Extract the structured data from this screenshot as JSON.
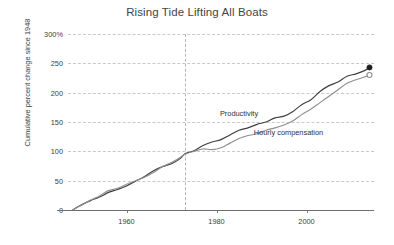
{
  "chart_data": {
    "type": "line",
    "title": "Rising Tide Lifting All Boats",
    "xlabel": "",
    "ylabel": "Cumulative percent change since 1948",
    "xlim": [
      1947,
      2015
    ],
    "ylim": [
      0,
      300
    ],
    "grid": true,
    "legend_position": "inline-annotation",
    "ytick_labels": [
      "0",
      "50",
      "100",
      "150",
      "200",
      "250",
      "300%"
    ],
    "ytick_values": [
      0,
      50,
      100,
      150,
      200,
      250,
      300
    ],
    "xtick_labels": [
      "1960",
      "1980",
      "2000"
    ],
    "xtick_values": [
      1960,
      1980,
      2000
    ],
    "annotations": [
      {
        "name": "divergence-line",
        "type": "vline",
        "x": 1973,
        "style": "dashed"
      }
    ],
    "series": [
      {
        "name": "Productivity",
        "color": "#3f3f3f",
        "end_marker": "filled-circle",
        "end_value": 243,
        "label_x": 1985,
        "label_y": 165,
        "x": [
          1948,
          1950,
          1952,
          1954,
          1956,
          1958,
          1960,
          1962,
          1964,
          1966,
          1968,
          1970,
          1972,
          1973,
          1975,
          1977,
          1979,
          1981,
          1983,
          1985,
          1987,
          1989,
          1991,
          1993,
          1995,
          1997,
          1999,
          2001,
          2003,
          2005,
          2007,
          2009,
          2011,
          2013,
          2014
        ],
        "values": [
          0,
          9,
          16,
          22,
          30,
          35,
          41,
          49,
          57,
          67,
          74,
          79,
          88,
          96,
          101,
          110,
          116,
          120,
          128,
          136,
          140,
          146,
          150,
          157,
          160,
          168,
          180,
          188,
          202,
          212,
          218,
          228,
          232,
          238,
          243
        ]
      },
      {
        "name": "Hourly compensation",
        "color": "#8f8f8f",
        "end_marker": "open-circle",
        "end_value": 230,
        "label_x": 1996,
        "label_y": 133,
        "x": [
          1948,
          1950,
          1952,
          1954,
          1956,
          1958,
          1960,
          1962,
          1964,
          1966,
          1968,
          1970,
          1972,
          1973,
          1975,
          1977,
          1979,
          1981,
          1983,
          1985,
          1987,
          1989,
          1991,
          1993,
          1995,
          1997,
          1999,
          2001,
          2003,
          2005,
          2007,
          2009,
          2011,
          2013,
          2014
        ],
        "values": [
          0,
          8,
          17,
          24,
          33,
          37,
          44,
          50,
          56,
          64,
          74,
          81,
          90,
          95,
          100,
          104,
          103,
          106,
          114,
          122,
          127,
          130,
          136,
          140,
          145,
          152,
          163,
          172,
          183,
          194,
          205,
          216,
          222,
          227,
          230
        ]
      }
    ]
  }
}
